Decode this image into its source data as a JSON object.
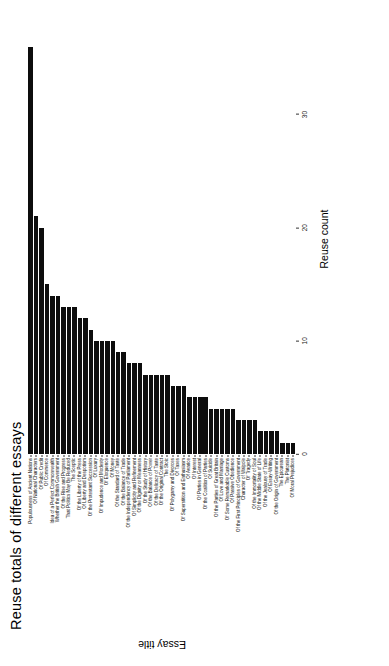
{
  "chart_data": {
    "type": "bar",
    "orientation": "horizontal",
    "title": "Reuse totals of different essays",
    "xlabel": "Reuse count",
    "ylabel": "Essay title",
    "xlim": [
      0,
      38
    ],
    "xticks": [
      0,
      10,
      20,
      30
    ],
    "xtick_labels": [
      "0",
      "10",
      "20",
      "30"
    ],
    "grid": false,
    "legend": null,
    "bar_color": "#0d0d0d",
    "categories": [
      "Populousness of Ancient Nations",
      "Of National Characters",
      "Of Public Credit",
      "Of Commerce",
      "Idea of a Perfect Commonwealth",
      "Whether the British Government",
      "Of the Rise and Progress",
      "That Politics May Be Reduced",
      "The Sceptic",
      "Of the Liberty of the Press",
      "Of Liberty and Despotism",
      "Of the Protestant Succession",
      "Of Luxury",
      "Of Impudence and Modesty",
      "Of Eloquence",
      "Of Money",
      "Of the Standard of Taste",
      "Of the Balance of Trade",
      "Of the Independency of Parliament",
      "Of Simplicity and Refinement",
      "Of the Dignity or Meanness",
      "Of the Study of History",
      "Of the Balance of Power",
      "Of the Delicacy of Taste",
      "Of the Original Contract",
      "The Stoic",
      "Of Polygamy and Divorces",
      "Of Taxes",
      "Of Superstition and Enthusiasm",
      "Of Avarice",
      "Of Interest",
      "Of Parties in General",
      "Of the Coalition of Parties",
      "Of Suicide",
      "Of the Parties of Great Britain",
      "Of Love and Marriage",
      "Of Some Remarkable Customs",
      "Of Passive Obedience",
      "Of the First Principles of Government",
      "Character of Walpole",
      "Of Tragedy",
      "Of the Immortality of Soul",
      "Of the Middle State of Life",
      "Of the Jealousy of Trade",
      "Of Essay-Writing",
      "Of the Origin of Government",
      "The Epicurean",
      "The Platonist",
      "Of Moral Prejudices"
    ],
    "values": [
      36,
      21,
      20,
      15,
      14,
      14,
      13,
      13,
      13,
      12,
      12,
      11,
      10,
      10,
      10,
      10,
      9,
      9,
      8,
      8,
      8,
      7,
      7,
      7,
      7,
      7,
      6,
      6,
      6,
      5,
      5,
      5,
      5,
      4,
      4,
      4,
      4,
      4,
      3,
      3,
      3,
      3,
      2,
      2,
      2,
      2,
      1,
      1,
      1
    ]
  }
}
